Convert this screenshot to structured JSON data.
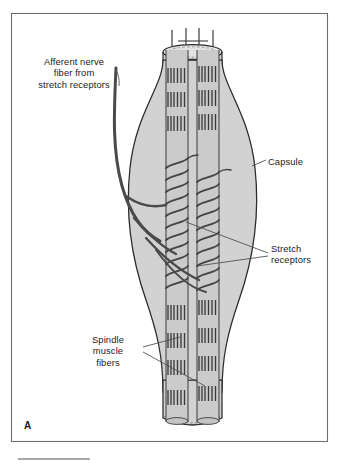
{
  "figure": {
    "panel_letter": "A",
    "frame": {
      "stroke": "#6e6e6e",
      "fill": "#ffffff"
    },
    "rule": {
      "present": true,
      "color": "#8a8a8a"
    }
  },
  "labels": {
    "afferent": {
      "text": "Afferent nerve\nfiber from\nstretch receptors",
      "align": "center"
    },
    "capsule": {
      "text": "Capsule",
      "align": "left"
    },
    "stretch_receptors": {
      "text": "Stretch\nreceptors",
      "align": "left"
    },
    "spindle_muscle_fibers": {
      "text": "Spindle\nmuscle\nfibers",
      "align": "center"
    }
  },
  "colors": {
    "capsule_fill": "#d2d2d2",
    "capsule_stroke": "#2a2a2a",
    "fiber_fill": "#c9c9c9",
    "fiber_stroke": "#3a3a3a",
    "striation": "#3b3b3b",
    "nerve": "#4a4a4a",
    "receptor_coil": "#454545",
    "leader_line": "#4a4a4a",
    "text": "#1b1b1b",
    "background": "#ffffff"
  },
  "structures": [
    {
      "name": "capsule",
      "description": "outer spindle-shaped connective tissue capsule, light gray fill"
    },
    {
      "name": "spindle-muscle-fibers",
      "description": "two central intrafusal muscle fibers running vertically with dark striations at the poles"
    },
    {
      "name": "stretch-receptors",
      "description": "dark annulospiral nerve endings coiled around the equatorial region of both fibers"
    },
    {
      "name": "afferent-nerve-fiber",
      "description": "thick nerve trunk entering from upper left and branching to the receptors"
    }
  ]
}
